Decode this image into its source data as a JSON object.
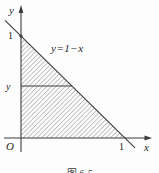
{
  "figure": {
    "y_axis_label": "y",
    "x_axis_label": "x",
    "origin_label": "O",
    "y_intercept_label": "1",
    "x_intercept_label": "1",
    "y_level_label": "y",
    "line_equation_label": "y=1−x",
    "caption": "图 6-5",
    "colors": {
      "stroke": "#3c3c3c",
      "hatch": "#8f8f8f",
      "text": "#1f1f1f",
      "background": "#fdfdfd"
    }
  }
}
